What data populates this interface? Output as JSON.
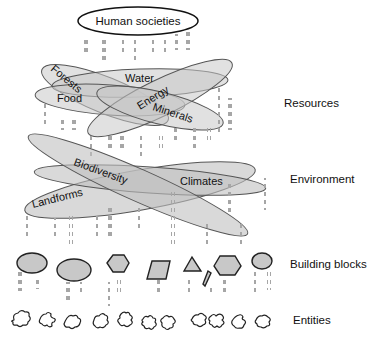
{
  "title_node": {
    "label": "Human societies"
  },
  "resources": {
    "items": [
      "Forests",
      "Water",
      "Food",
      "Energy",
      "Minerals"
    ]
  },
  "environment": {
    "items": [
      "Biodiversity",
      "Climates",
      "Landforms"
    ]
  },
  "building_blocks": {
    "shapes": [
      "ellipse",
      "ellipse",
      "hexagon",
      "parallelogram",
      "triangle",
      "sliver",
      "hexagon",
      "circle"
    ]
  },
  "entities": {
    "count": 11,
    "shape": "blob"
  },
  "tier_labels": {
    "resources": "Resources",
    "environment": "Environment",
    "building_blocks": "Building blocks",
    "entities": "Entities"
  },
  "colors": {
    "ellipse_fill": "#c8c8c8",
    "ellipse_stroke": "#555555",
    "dot": "#a6a6a6",
    "outline": "#222222"
  }
}
